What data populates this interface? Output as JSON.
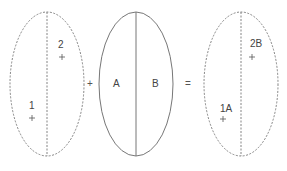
{
  "diagram": {
    "type": "set-equation",
    "left_ellipse": {
      "style": "dashed",
      "points": [
        {
          "label": "2",
          "position": "upper-right"
        },
        {
          "label": "1",
          "position": "lower-left"
        }
      ]
    },
    "operator_plus": "+",
    "middle_ellipse": {
      "style": "solid",
      "halves": [
        {
          "label": "A",
          "side": "left"
        },
        {
          "label": "B",
          "side": "right"
        }
      ]
    },
    "operator_equals": "=",
    "right_ellipse": {
      "style": "dashed",
      "points": [
        {
          "label": "2B",
          "position": "upper-right"
        },
        {
          "label": "1A",
          "position": "lower-left"
        }
      ]
    }
  },
  "colors": {
    "stroke": "#777777",
    "text": "#444444",
    "background": "#ffffff"
  }
}
